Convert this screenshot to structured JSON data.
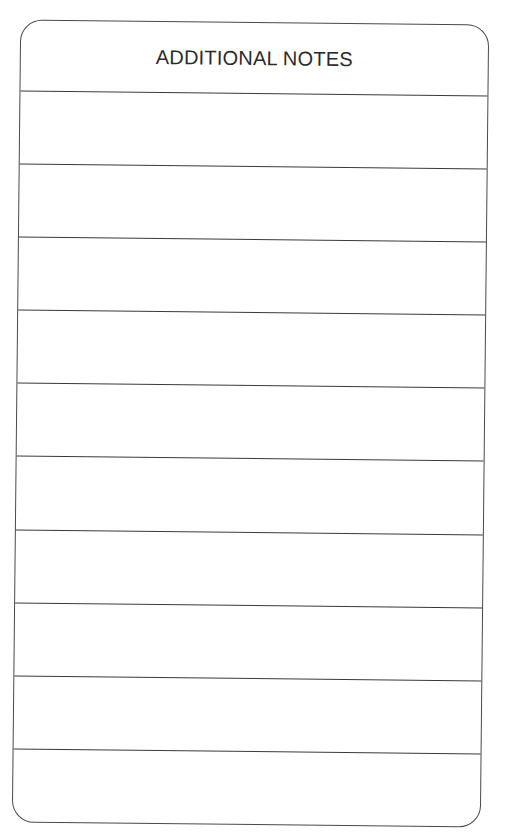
{
  "card": {
    "title": "ADDITIONAL NOTES",
    "line_count": 10,
    "lines": [
      {
        "top": 70
      },
      {
        "top": 143
      },
      {
        "top": 216
      },
      {
        "top": 289
      },
      {
        "top": 362
      },
      {
        "top": 435
      },
      {
        "top": 509
      },
      {
        "top": 582
      },
      {
        "top": 655
      },
      {
        "top": 728
      }
    ],
    "colors": {
      "border": "#4a4a4a",
      "text": "#2a2a2a",
      "background": "#ffffff"
    }
  }
}
